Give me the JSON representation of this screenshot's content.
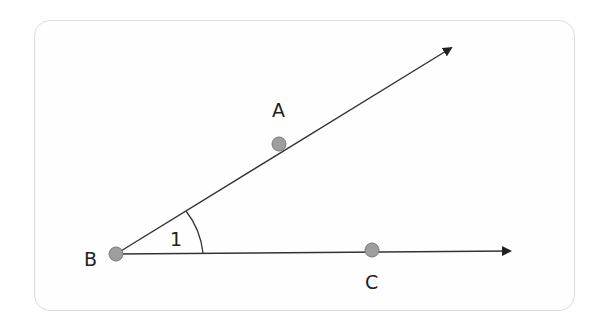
{
  "diagram": {
    "type": "angle",
    "points": [
      {
        "id": "A",
        "label": "A",
        "x": 279,
        "y": 144
      },
      {
        "id": "B",
        "label": "B",
        "x": 116,
        "y": 254
      },
      {
        "id": "C",
        "label": "C",
        "x": 372,
        "y": 250
      }
    ],
    "rays": [
      {
        "from": "B",
        "through": "A",
        "label": "ray BA"
      },
      {
        "from": "B",
        "through": "C",
        "label": "ray BC"
      }
    ],
    "angle": {
      "vertex": "B",
      "label": "1"
    },
    "colors": {
      "line": "#333333",
      "point": "#9e9e9e",
      "point_stroke": "#7a7a7a",
      "border": "#dcdcdc"
    }
  }
}
